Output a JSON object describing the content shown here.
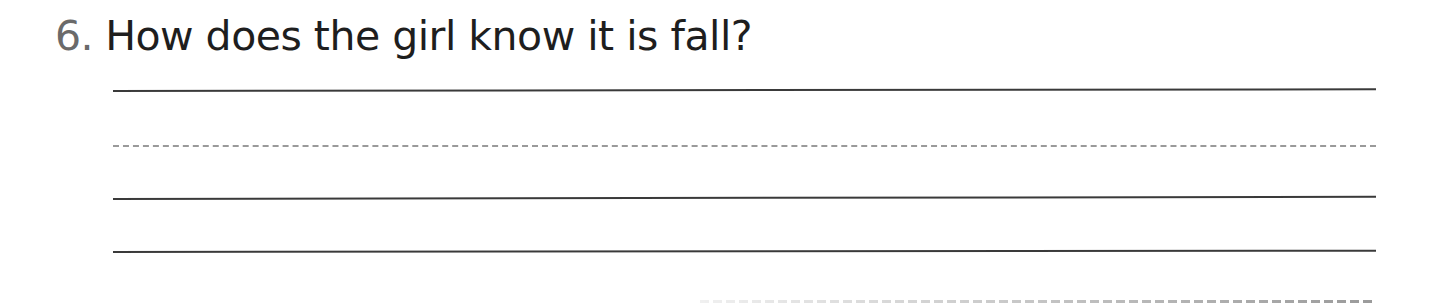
{
  "question": {
    "number": "6.",
    "text": "How does the girl know it is fall?"
  },
  "answer_lines": [
    {
      "style": "solid",
      "y": 90
    },
    {
      "style": "dashed",
      "y": 145
    },
    {
      "style": "solid",
      "y": 198
    },
    {
      "style": "solid",
      "y": 251
    },
    {
      "style": "dashed-faded",
      "y": 301
    }
  ],
  "colors": {
    "number": "#6a6a6a",
    "text": "#1e1e1e",
    "solid_line": "#3a3a3a",
    "dashed_line": "#9a9a9a"
  }
}
